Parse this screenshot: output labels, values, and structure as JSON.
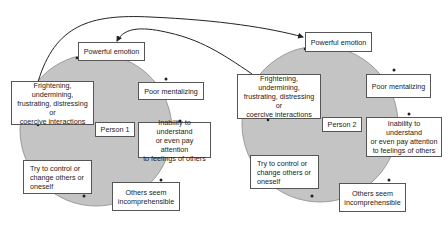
{
  "diagram": {
    "type": "cycle-diagram",
    "colors": {
      "circle_fill": "#c4c4c4",
      "circle_stroke": "#8a8a8a",
      "box_border": "#555555",
      "arrow": "#222222"
    },
    "persons": [
      {
        "label": "Person 1",
        "nodes": {
          "powerful_emotion": "Powerful emotion",
          "poor_mentalizing": "Poor mentalizing",
          "inability": "Inability to understand\nor even pay attention\nto feelings of others",
          "others_seem": "Others seem\nincomprehensible",
          "try_to_control": "Try to control or\nchange others or\noneself",
          "frightening": "Frightening, undermining,\nfrustrating, distressing or\ncoercive interactions"
        }
      },
      {
        "label": "Person 2",
        "nodes": {
          "powerful_emotion": "Powerful emotion",
          "poor_mentalizing": "Poor mentalizing",
          "inability": "Inability to understand\nor even pay attention\nto feelings of others",
          "others_seem": "Others seem\nincomprehensible",
          "try_to_control": "Try to control or\nchange others or\noneself",
          "frightening": "Frightening, undermining,\nfrustrating, distressing or\ncoercive interactions"
        }
      }
    ],
    "cross_links": [
      {
        "from": "Person 1 frightening interactions",
        "to": "Person 2 powerful emotion"
      },
      {
        "from": "Person 2 frightening interactions",
        "to": "Person 1 powerful emotion"
      }
    ]
  }
}
